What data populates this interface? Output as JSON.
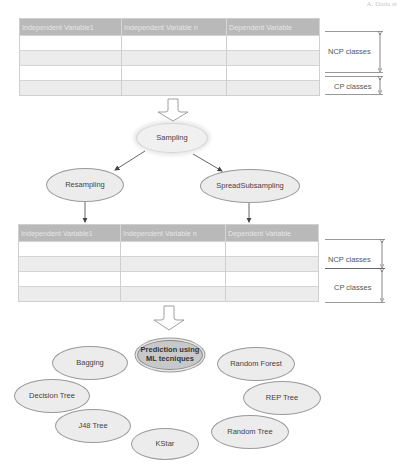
{
  "corner_label": "A. Datia et",
  "table_top": {
    "headers": [
      "Independent Variable1",
      "Independent Variable n",
      "Dependent Variable"
    ],
    "row_count": 4
  },
  "table_bottom": {
    "headers": [
      "Independent Variable1",
      "Independent Variable n",
      "Dependent Variable"
    ],
    "row_count": 4
  },
  "brackets_top": {
    "ncp": "NCP classes",
    "cp": "CP classes"
  },
  "brackets_bottom": {
    "ncp": "NCP classes",
    "cp": "CP classes"
  },
  "nodes": {
    "sampling": "Sampling",
    "resampling": "Resampling",
    "spread_subsampling": "SpreadSubsampling",
    "prediction": "Prediction using ML tecniques",
    "bagging": "Bagging",
    "random_forest": "Random Forest",
    "decision_tree": "Decision Tree",
    "rep_tree": "REP Tree",
    "j48_tree": "J48 Tree",
    "random_tree": "Random Tree",
    "kstar": "KStar"
  },
  "colors": {
    "table_header": "#b9b9b9",
    "row_gray": "#ececec",
    "ellipse_fill": "#ececec",
    "prediction_fill": "#c8c8c8",
    "arrow": "#555555"
  }
}
